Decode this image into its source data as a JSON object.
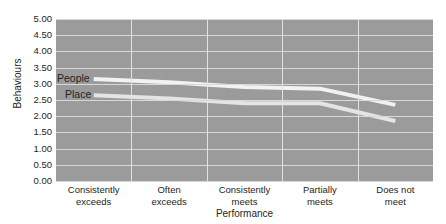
{
  "chart_data": {
    "type": "line",
    "title": "",
    "xlabel": "Performance",
    "ylabel": "Behaviours",
    "categories": [
      "Consistently exceeds",
      "Often exceeds",
      "Consistently meets",
      "Partially meets",
      "Does not meet"
    ],
    "category_lines": [
      [
        "Consistently",
        "exceeds"
      ],
      [
        "Often",
        "exceeds"
      ],
      [
        "Consistently",
        "meets"
      ],
      [
        "Partially",
        "meets"
      ],
      [
        "Does not",
        "meet"
      ]
    ],
    "series": [
      {
        "name": "People",
        "values": [
          3.15,
          3.05,
          2.9,
          2.85,
          2.35
        ],
        "color": "#f2f2f2"
      },
      {
        "name": "Place",
        "values": [
          2.65,
          2.55,
          2.4,
          2.4,
          1.85
        ],
        "color": "#e4e4e4"
      }
    ],
    "ylim": [
      0,
      5
    ],
    "ytick_labels": [
      "5.00",
      "4.50",
      "4.00",
      "3.50",
      "3.00",
      "2.50",
      "2.00",
      "1.50",
      "1.00",
      "0.50",
      "0.00"
    ],
    "ytick_values": [
      5,
      4.5,
      4,
      3.5,
      3,
      2.5,
      2,
      1.5,
      1,
      0.5,
      0
    ],
    "grid": {
      "horizontal": true,
      "vertical": true
    },
    "legend": {
      "position": "inline-series-labels"
    },
    "colors": {
      "plot_background": "#9b9b9b",
      "horizontal_gridline": "#d8d8d8",
      "vertical_gridline": "#e2e2e2",
      "text": "#231f20",
      "page_background": "#ffffff"
    }
  }
}
